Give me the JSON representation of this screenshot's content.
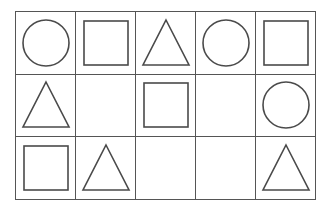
{
  "figure": {
    "name": "shape-grid",
    "rows": 3,
    "columns": 5,
    "stroke_color": "#4a4a4a",
    "grid_line_color": "#555555",
    "background_color": "#ffffff"
  },
  "grid": {
    "cells": [
      [
        {
          "shape": "circle",
          "label": "circle"
        },
        {
          "shape": "square",
          "label": "square"
        },
        {
          "shape": "triangle",
          "label": "triangle"
        },
        {
          "shape": "circle",
          "label": "circle"
        },
        {
          "shape": "square",
          "label": "square"
        }
      ],
      [
        {
          "shape": "triangle",
          "label": "triangle"
        },
        {
          "shape": "empty",
          "label": ""
        },
        {
          "shape": "square",
          "label": "square"
        },
        {
          "shape": "empty",
          "label": ""
        },
        {
          "shape": "circle",
          "label": "circle"
        }
      ],
      [
        {
          "shape": "square",
          "label": "square"
        },
        {
          "shape": "triangle",
          "label": "triangle"
        },
        {
          "shape": "empty",
          "label": ""
        },
        {
          "shape": "empty",
          "label": ""
        },
        {
          "shape": "triangle",
          "label": "triangle"
        }
      ]
    ]
  }
}
